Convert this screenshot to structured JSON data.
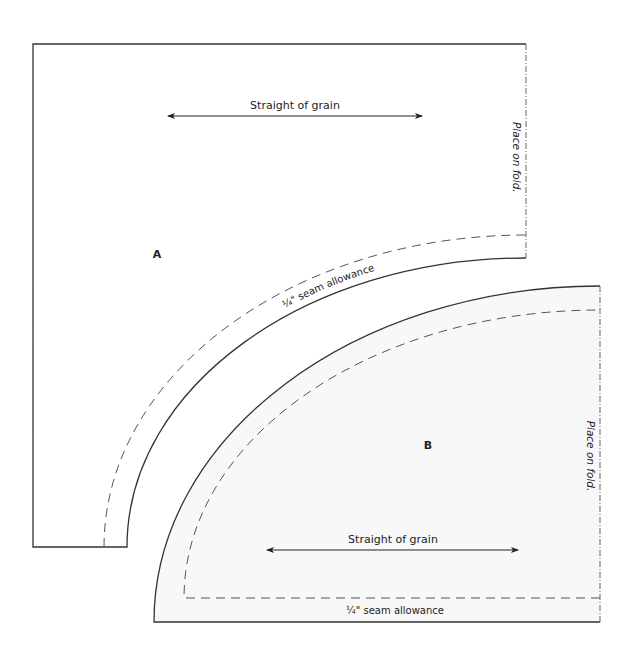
{
  "diagram": {
    "type": "sewing-pattern",
    "colors": {
      "outline": "#333333",
      "dashed": "#555555",
      "piece_b_fill": "#f8f8f8",
      "background": "#ffffff",
      "text": "#222222"
    },
    "piece_a": {
      "label": "A",
      "grain_label": "Straight of grain",
      "fold_label": "Place on fold.",
      "seam_label": "¼\" seam allowance"
    },
    "piece_b": {
      "label": "B",
      "grain_label": "Straight of grain",
      "fold_label": "Place on fold.",
      "seam_label": "¼\" seam allowance"
    }
  }
}
